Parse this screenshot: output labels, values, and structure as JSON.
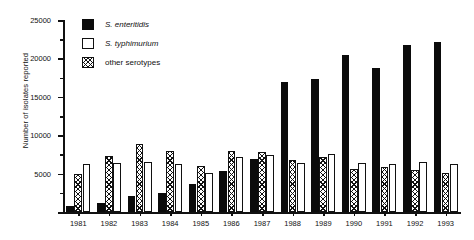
{
  "chart_data": {
    "type": "bar",
    "title": "",
    "xlabel": "",
    "ylabel": "Number of isolates reported",
    "ylim": [
      0,
      25000
    ],
    "ytick_values": [
      0,
      5000,
      10000,
      15000,
      20000,
      25000
    ],
    "ytick_labels": [
      "0",
      "5000",
      "10000",
      "15000",
      "20000",
      "25000"
    ],
    "yminor_values": [
      2500,
      7500,
      12500,
      17500,
      22500
    ],
    "grid": false,
    "legend_position": "top-left-inside",
    "categories": [
      "1981",
      "1982",
      "1983",
      "1984",
      "1985",
      "1986",
      "1987",
      "1988",
      "1989",
      "1990",
      "1991",
      "1992",
      "1993"
    ],
    "series": [
      {
        "name": "S. enteritidis",
        "fill": "solid-black",
        "color": "#0b0b0b",
        "values": [
          800,
          1200,
          2100,
          2500,
          3700,
          5400,
          6900,
          16900,
          17300,
          20400,
          18700,
          21800,
          22100
        ]
      },
      {
        "name": "S. typhimurium",
        "fill": "open-white",
        "color": "#ffffff",
        "values": [
          6200,
          6400,
          6500,
          6200,
          5100,
          7100,
          7400,
          6400,
          7600,
          6400,
          6200,
          6500,
          6200
        ]
      },
      {
        "name": "other serotypes",
        "fill": "crosshatch",
        "color": "#ffffff",
        "values": [
          5000,
          7300,
          8900,
          7900,
          6000,
          7900,
          7800,
          6800,
          7200,
          5600,
          5800,
          5500,
          5100
        ]
      }
    ],
    "series_draw_order": [
      "S. enteritidis",
      "other serotypes",
      "S. typhimurium"
    ]
  },
  "legend": {
    "items": [
      {
        "label": "S. enteritidis",
        "style": "sw-ent",
        "italic": true
      },
      {
        "label": "S. typhimurium",
        "style": "sw-typ",
        "italic": true
      },
      {
        "label": "other serotypes",
        "style": "sw-oth",
        "italic": false
      }
    ]
  }
}
